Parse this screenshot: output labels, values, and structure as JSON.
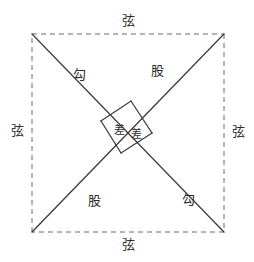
{
  "figure": {
    "width": 254,
    "height": 262,
    "background": "#ffffff",
    "stroke_color": "#3a3a3a",
    "dashed_color": "#6b6b6b",
    "text_color": "#2b2b2b"
  },
  "outer_square": {
    "name": "xian-square",
    "style": "dashed",
    "left": 32,
    "top": 34,
    "right": 224,
    "bottom": 232
  },
  "labels": {
    "hypotenuse": "弦",
    "shorter_leg": "勾",
    "longer_leg": "股",
    "difference": "差"
  },
  "annotations": [
    {
      "id": "xian-top",
      "text": "弦",
      "x": 128,
      "y": 20,
      "size": "normal"
    },
    {
      "id": "xian-left",
      "text": "弦",
      "x": 17,
      "y": 130,
      "size": "normal"
    },
    {
      "id": "xian-right",
      "text": "弦",
      "x": 238,
      "y": 131,
      "size": "normal"
    },
    {
      "id": "xian-bottom",
      "text": "弦",
      "x": 128,
      "y": 244,
      "size": "normal"
    },
    {
      "id": "gou-top",
      "text": "勾",
      "x": 79,
      "y": 74,
      "size": "normal"
    },
    {
      "id": "gu-top",
      "text": "股",
      "x": 157,
      "y": 70,
      "size": "normal"
    },
    {
      "id": "gu-bottom",
      "text": "股",
      "x": 94,
      "y": 200,
      "size": "normal"
    },
    {
      "id": "gou-bottom",
      "text": "勾",
      "x": 188,
      "y": 199,
      "size": "normal"
    },
    {
      "id": "cha-left",
      "text": "差",
      "x": 119,
      "y": 130,
      "size": "small"
    },
    {
      "id": "cha-right",
      "text": "差",
      "x": 136,
      "y": 134,
      "size": "small"
    }
  ],
  "strokes": [
    {
      "id": "diag-tl-br",
      "points": "32,34 224,232"
    },
    {
      "id": "diag-bl-tr",
      "points": "32,232 224,34"
    },
    {
      "id": "inner-sq-top-left",
      "points": "131,101 101,121"
    },
    {
      "id": "inner-sq-left-bottom",
      "points": "101,121 121,153"
    },
    {
      "id": "inner-sq-bottom-right",
      "points": "121,153 152,133"
    },
    {
      "id": "inner-sq-right-top",
      "points": "152,133 131,101"
    }
  ]
}
